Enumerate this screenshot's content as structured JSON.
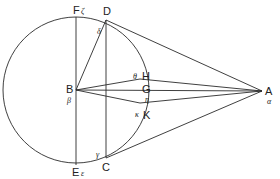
{
  "diagram": {
    "type": "geometry",
    "stroke_color": "#2a2a2a",
    "background": "#ffffff",
    "circle": {
      "center": "B",
      "cx": 76,
      "cy": 90,
      "r": 73
    },
    "points": {
      "F": {
        "label": "F",
        "greek": "ζ",
        "x": 76,
        "y": 17
      },
      "D": {
        "label": "D",
        "greek": "δ",
        "x": 106,
        "y": 20
      },
      "B": {
        "label": "B",
        "greek": "β",
        "x": 76,
        "y": 90
      },
      "H": {
        "label": "H",
        "greek": "θ",
        "x": 140,
        "y": 79
      },
      "G": {
        "label": "G",
        "greek": "η",
        "x": 149,
        "y": 91
      },
      "K": {
        "label": "K",
        "greek": "κ",
        "x": 140,
        "y": 103
      },
      "A": {
        "label": "A",
        "greek": "α",
        "x": 262,
        "y": 91
      },
      "E": {
        "label": "E",
        "greek": "ε",
        "x": 76,
        "y": 165
      },
      "C": {
        "label": "C",
        "greek": "γ",
        "x": 106,
        "y": 158
      }
    },
    "segments": [
      "FE",
      "DC",
      "BD",
      "AD",
      "AC",
      "BA",
      "BH",
      "BK",
      "HA",
      "KA"
    ]
  }
}
